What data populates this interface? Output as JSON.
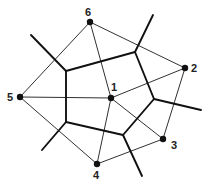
{
  "diagram": {
    "type": "voronoi-delaunay",
    "colors": {
      "line": "#1a1a1a",
      "background": "#ffffff"
    },
    "sites": [
      {
        "id": "1",
        "label": "1"
      },
      {
        "id": "2",
        "label": "2"
      },
      {
        "id": "3",
        "label": "3"
      },
      {
        "id": "4",
        "label": "4"
      },
      {
        "id": "5",
        "label": "5"
      },
      {
        "id": "6",
        "label": "6"
      }
    ],
    "delaunay_edges": [
      [
        "6",
        "2"
      ],
      [
        "2",
        "3"
      ],
      [
        "3",
        "4"
      ],
      [
        "4",
        "5"
      ],
      [
        "5",
        "6"
      ],
      [
        "1",
        "2"
      ],
      [
        "1",
        "3"
      ],
      [
        "1",
        "4"
      ],
      [
        "1",
        "5"
      ],
      [
        "1",
        "6"
      ]
    ],
    "voronoi_cell_of": "1",
    "voronoi_vertices": [
      "A",
      "B",
      "C",
      "D",
      "E"
    ],
    "voronoi_edges": [
      [
        "A",
        "B"
      ],
      [
        "B",
        "C"
      ],
      [
        "C",
        "D"
      ],
      [
        "D",
        "E"
      ],
      [
        "E",
        "A"
      ]
    ],
    "voronoi_rays": [
      "A",
      "B",
      "C",
      "D",
      "E"
    ]
  }
}
